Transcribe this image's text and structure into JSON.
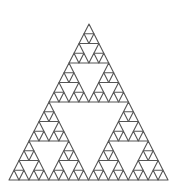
{
  "diagram": {
    "type": "sierpinski-triangle",
    "depth": 4,
    "vertices": {
      "apex": [
        89,
        24
      ],
      "bottom_left": [
        9,
        180
      ],
      "bottom_right": [
        168,
        180
      ]
    },
    "stroke_color": "#555555",
    "stroke_width": 1.1,
    "fill_color": "#ffffff",
    "background": "#ffffff"
  }
}
